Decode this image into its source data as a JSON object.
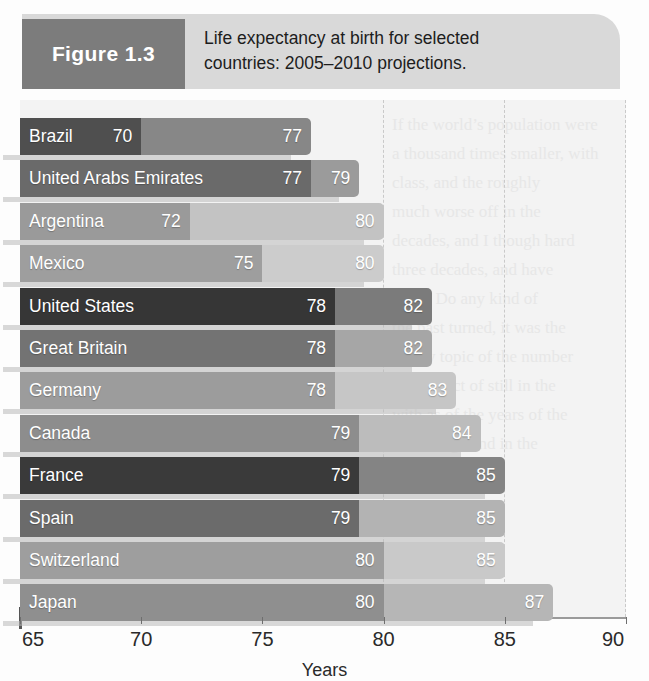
{
  "figure": {
    "tag": "Figure 1.3",
    "caption_line1": "Life expectancy at birth for selected",
    "caption_line2": "countries: 2005–2010 projections.",
    "tag_bg": "#7c7c7c",
    "caption_bg": "#d9d9d9"
  },
  "bleed_text": {
    "l1": "If the world’s population were",
    "l2": "a thousand times smaller, with",
    "l3": "class, and the roughly",
    "l4": "much worse off in the",
    "l5": "decades, and I though hard",
    "l6": "three decades, and have",
    "l7": "thing. Do any kind of",
    "l8": "the past turned, it was the",
    "l9": "theory topic of the number",
    "l10": "the subject of still in the",
    "l11": "with as of the years of the",
    "l12": "knowledge and in the"
  },
  "chart_data": {
    "type": "bar",
    "orientation": "horizontal",
    "title": "Life expectancy at birth for selected countries: 2005–2010 projections.",
    "xlabel": "Years",
    "ylabel": "",
    "xlim": [
      65,
      90
    ],
    "xticks": [
      65,
      70,
      75,
      80,
      85,
      90
    ],
    "grid": "dashed vertical gridlines at 80, 85, 90",
    "legend": "none",
    "series": [
      {
        "name": "male",
        "values": [
          70,
          77,
          72,
          75,
          78,
          78,
          78,
          79,
          79,
          79,
          80,
          80
        ]
      },
      {
        "name": "female",
        "values": [
          77,
          79,
          80,
          80,
          82,
          82,
          83,
          84,
          85,
          85,
          85,
          87
        ]
      }
    ],
    "categories": [
      "Brazil",
      "United Arabs Emirates",
      "Argentina",
      "Mexico",
      "United States",
      "Great Britain",
      "Germany",
      "Canada",
      "France",
      "Spain",
      "Switzerland",
      "Japan"
    ],
    "rows": [
      {
        "country": "Brazil",
        "male": 70,
        "female": 77,
        "male_color": "#4f4f4f",
        "female_color": "#878787"
      },
      {
        "country": "United Arabs Emirates",
        "male": 77,
        "female": 79,
        "male_color": "#6a6a6a",
        "female_color": "#9b9b9b"
      },
      {
        "country": "Argentina",
        "male": 72,
        "female": 80,
        "male_color": "#9a9a9a",
        "female_color": "#c3c3c3"
      },
      {
        "country": "Mexico",
        "male": 75,
        "female": 80,
        "male_color": "#9e9e9e",
        "female_color": "#cccccc"
      },
      {
        "country": "United States",
        "male": 78,
        "female": 82,
        "male_color": "#363636",
        "female_color": "#7b7b7b"
      },
      {
        "country": "Great Britain",
        "male": 78,
        "female": 82,
        "male_color": "#737373",
        "female_color": "#a6a6a6"
      },
      {
        "country": "Germany",
        "male": 78,
        "female": 83,
        "male_color": "#9c9c9c",
        "female_color": "#c6c6c6"
      },
      {
        "country": "Canada",
        "male": 79,
        "female": 84,
        "male_color": "#8d8d8d",
        "female_color": "#bcbcbc"
      },
      {
        "country": "France",
        "male": 79,
        "female": 85,
        "male_color": "#3a3a3a",
        "female_color": "#848484"
      },
      {
        "country": "Spain",
        "male": 79,
        "female": 85,
        "male_color": "#6b6b6b",
        "female_color": "#b3b3b3"
      },
      {
        "country": "Switzerland",
        "male": 80,
        "female": 85,
        "male_color": "#9e9e9e",
        "female_color": "#c9c9c9"
      },
      {
        "country": "Japan",
        "male": 80,
        "female": 87,
        "male_color": "#8f8f8f",
        "female_color": "#b6b6b6"
      }
    ]
  }
}
